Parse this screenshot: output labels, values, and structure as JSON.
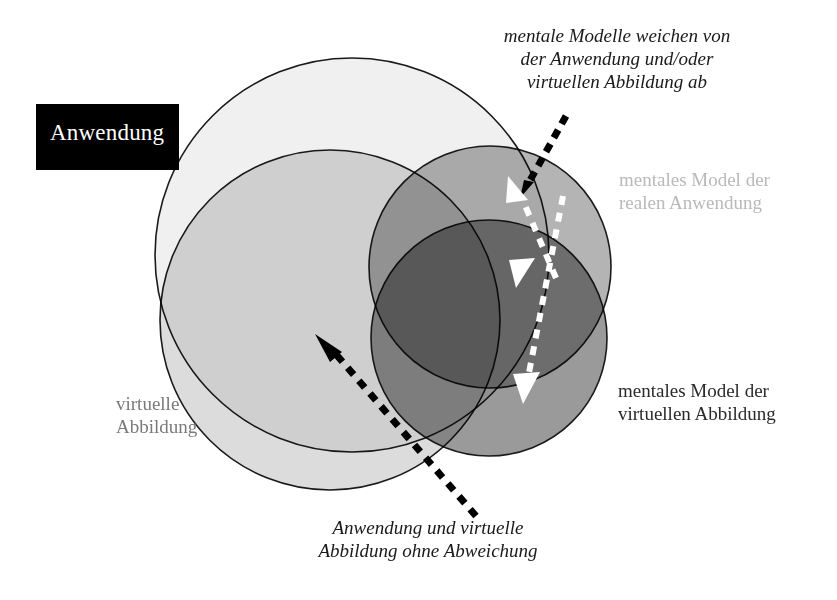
{
  "figure": {
    "background_color": "#ffffff"
  },
  "badge": {
    "name": "anwendung-badge",
    "label": "Anwendung",
    "background_color": "#000000",
    "text_color": "#ffffff"
  },
  "labels": {
    "top_note": "mentale Modelle weichen von\nder Anwendung und/oder\nvirtuellen Abbildung ab",
    "bottom_note": "Anwendung und virtuelle\nAbbildung ohne Abweichung",
    "mental_real": "mentales Model der\nrealen Anwendung",
    "mental_virtual": "mentales Model der\nvirtuellen Abbildung",
    "virtuelle_abbildung": "virtuelle\nAbbildung"
  },
  "label_colors": {
    "top_note": "#1a1a1a",
    "bottom_note": "#1a1a1a",
    "mental_real": "#b9b9b9",
    "mental_virtual": "#2a2a2a",
    "virtuelle_abbildung": "#7a7a7a"
  },
  "circles": [
    {
      "name": "anwendung-circle",
      "meaning": "Anwendung",
      "cx": 352,
      "cy": 255,
      "r": 197,
      "fill": "#f0f0f0",
      "stroke": "#1a1a1a"
    },
    {
      "name": "virtuelle-abbildung-circle",
      "meaning": "virtuelle Abbildung",
      "cx": 330,
      "cy": 320,
      "r": 170,
      "fill": "#d2d2d2",
      "stroke": "#1a1a1a"
    },
    {
      "name": "mentales-model-reale-anwendung-circle",
      "meaning": "mentales Model der realen Anwendung",
      "cx": 490,
      "cy": 267,
      "r": 121,
      "fill": "#b0b0b0",
      "stroke": "#1a1a1a"
    },
    {
      "name": "mentales-model-virtuelle-abbildung-circle",
      "meaning": "mentales Model der virtuellen Abbildung",
      "cx": 489,
      "cy": 338,
      "r": 118,
      "fill": "#8c8c8c",
      "stroke": "#1a1a1a"
    }
  ],
  "arrows": [
    {
      "name": "deviation-arrow-upper",
      "style": "dashed-white",
      "color": "#ffffff",
      "from": [
        545,
        295
      ],
      "to": [
        505,
        180
      ],
      "points_to": "mentales Model der realen Anwendung"
    },
    {
      "name": "deviation-arrow-lower",
      "style": "dashed-white",
      "color": "#ffffff",
      "from": [
        560,
        200
      ],
      "to": [
        523,
        396
      ],
      "points_to": "mentales Model der virtuellen Abbildung"
    },
    {
      "name": "deviation-callout-arrow",
      "style": "dashed-black",
      "color": "#000000",
      "from": [
        563,
        118
      ],
      "to": [
        524,
        188
      ],
      "points_to": "mentale Modelle weichen von der Anwendung und/oder virtuellen Abbildung ab"
    },
    {
      "name": "agreement-callout-arrow",
      "style": "dashed-black",
      "color": "#000000",
      "from": [
        472,
        512
      ],
      "to": [
        318,
        338
      ],
      "points_to": "Anwendung und virtuelle Abbildung ohne Abweichung"
    }
  ]
}
